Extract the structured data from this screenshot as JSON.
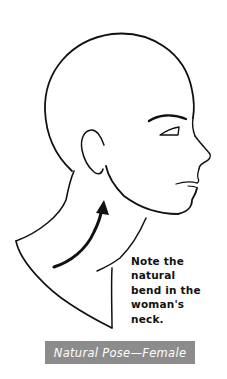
{
  "figure": {
    "annotation_lines": [
      "Note the",
      "natural",
      "bend in the",
      "woman's",
      "neck."
    ],
    "caption": "Natural Pose—Female",
    "colors": {
      "line": "#111111",
      "background": "#ffffff",
      "caption_bar": "#8c8c8c",
      "caption_text": "#ffffff"
    },
    "icons": {
      "arrow": "curved-arrow-up-icon"
    }
  }
}
